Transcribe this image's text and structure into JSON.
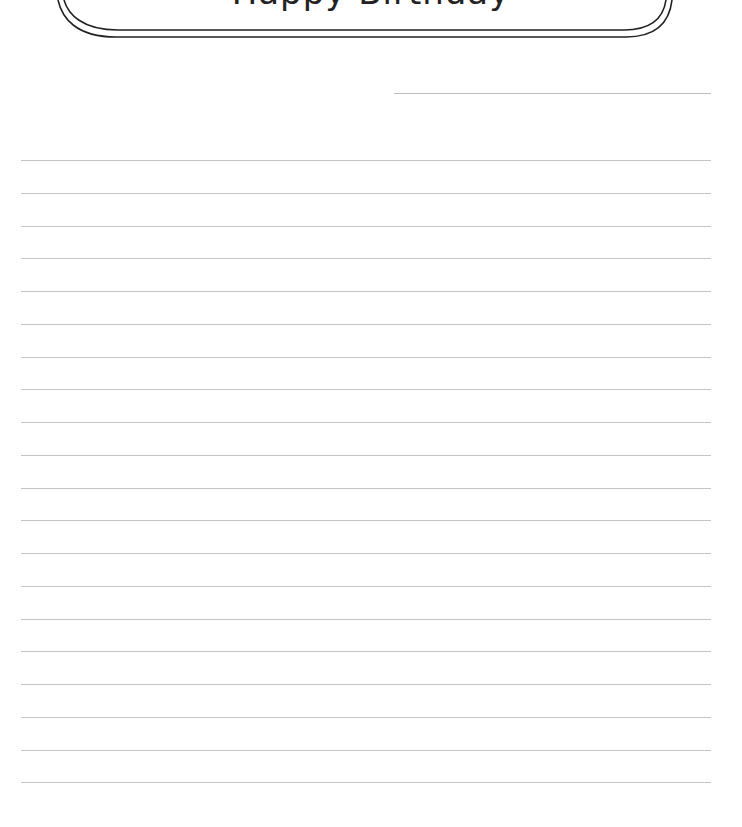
{
  "page": {
    "header": {
      "title": "Happy Birthday",
      "frame_style": "double-line rounded banner"
    },
    "date_field": {
      "value": ""
    },
    "ruled_lines": {
      "count": 20,
      "first_y": 160,
      "spacing": 32.75,
      "color": "#c4c4c4"
    },
    "colors": {
      "frame": "#222222",
      "background": "#ffffff"
    }
  }
}
